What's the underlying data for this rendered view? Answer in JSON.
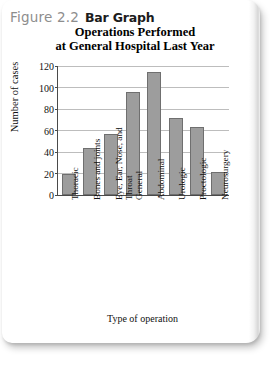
{
  "figure": {
    "number": "Figure 2.2",
    "label": "Bar Graph"
  },
  "chart_data": {
    "type": "bar",
    "title": "Operations Performed at General Hospital Last Year",
    "title_line1": "Operations Performed",
    "title_line2": "at General Hospital Last Year",
    "xlabel": "Type of operation",
    "ylabel": "Number of cases",
    "categories": [
      "Thoracic",
      "Bones and joints",
      "Eye, Ear, Nose, and Throat",
      "General",
      "Abdominal",
      "Urologic",
      "Proctologic",
      "Neurosurgery"
    ],
    "values": [
      20,
      44,
      57,
      96,
      114,
      72,
      63,
      21
    ],
    "ylim": [
      0,
      120
    ],
    "yticks": [
      0,
      20,
      40,
      60,
      80,
      100,
      120
    ],
    "grid": true,
    "legend": false,
    "bar_color": "#9d9d9d",
    "bar_edge_color": "#6f6f6f",
    "axis_color": "#4a4a4a",
    "gridline_color": "#bdbdbd"
  }
}
